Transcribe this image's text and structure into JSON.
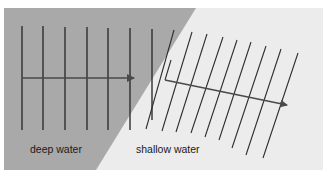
{
  "diagram": {
    "regions": [
      {
        "name": "deep water",
        "color": "#a9a9a9"
      },
      {
        "name": "shallow water",
        "color": "#ececec"
      }
    ],
    "labels": {
      "deep": "deep water",
      "shallow": "shallow water"
    },
    "colors": {
      "wavefront": "#2e2e2e",
      "arrow": "#4a4a4a",
      "background": "#ffffff"
    },
    "deep_wavefront_count": 7,
    "shallow_wavefront_count": 10
  }
}
